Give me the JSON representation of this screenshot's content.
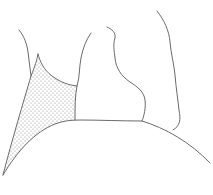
{
  "figure": {
    "description": "Line drawing with a stippled (dotted) region",
    "line_color": "#6a6a6a",
    "dot_color": "#8a8a8a",
    "background": "#ffffff",
    "regions": [
      {
        "name": "stippled-region",
        "fill": "dots"
      },
      {
        "name": "central-shape",
        "fill": "none"
      },
      {
        "name": "bump-shape",
        "fill": "none"
      },
      {
        "name": "right-contour",
        "fill": "none"
      },
      {
        "name": "base-arc",
        "fill": "none"
      }
    ]
  }
}
